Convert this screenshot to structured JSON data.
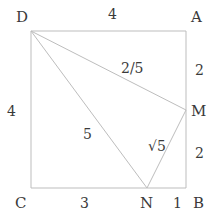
{
  "diagram": {
    "vertices": {
      "D": {
        "label": "D",
        "x": 31,
        "y": 31
      },
      "A": {
        "label": "A",
        "x": 186,
        "y": 31
      },
      "B": {
        "label": "B",
        "x": 186,
        "y": 188
      },
      "C": {
        "label": "C",
        "x": 31,
        "y": 188
      },
      "M": {
        "label": "M",
        "x": 186,
        "y": 110
      },
      "N": {
        "label": "N",
        "x": 147,
        "y": 188
      }
    },
    "lengths": {
      "DA": "4",
      "DC": "4",
      "AM": "2",
      "MB": "2",
      "CN": "3",
      "NB": "1",
      "DM": "2/5",
      "DN": "5",
      "MN": "√5"
    },
    "colors": {
      "line": "#bdbdbd",
      "text": "#3a3a3a",
      "background": "#ffffff"
    }
  }
}
